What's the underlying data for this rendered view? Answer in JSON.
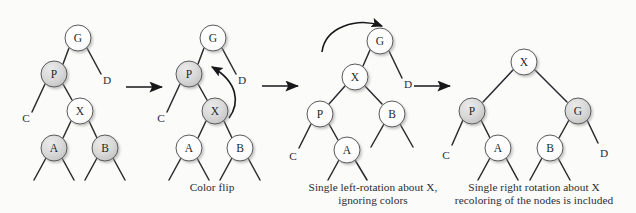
{
  "figure": {
    "background_color": "#fbfbfa",
    "node_fill_black": "#d6d6d6",
    "node_fill_red": "#fdfdfd",
    "node_stroke": "#5a5a5a",
    "edge_color": "#2b2b2f",
    "arrow_color": "#17171a",
    "text_color": "#2b2b33"
  },
  "steps": [
    {
      "id": "step-1",
      "caption": "",
      "nodes": [
        {
          "name": "G",
          "shade": "light",
          "cx": 78,
          "cy": 38
        },
        {
          "name": "P",
          "shade": "dark",
          "cx": 54,
          "cy": 74
        },
        {
          "name": "X",
          "shade": "light",
          "cx": 80,
          "cy": 111
        },
        {
          "name": "A",
          "shade": "dark",
          "cx": 54,
          "cy": 148
        },
        {
          "name": "B",
          "shade": "dark",
          "cx": 105,
          "cy": 148
        }
      ],
      "edge_labels": [
        {
          "name": "D",
          "x": 107,
          "y": 84
        },
        {
          "name": "C",
          "x": 26,
          "y": 122
        }
      ]
    },
    {
      "id": "step-2",
      "caption": "Color flip",
      "nodes": [
        {
          "name": "G",
          "shade": "light",
          "cx": 213,
          "cy": 38
        },
        {
          "name": "P",
          "shade": "dark",
          "cx": 189,
          "cy": 74
        },
        {
          "name": "X",
          "shade": "dark",
          "cx": 215,
          "cy": 111
        },
        {
          "name": "A",
          "shade": "light",
          "cx": 189,
          "cy": 148
        },
        {
          "name": "B",
          "shade": "light",
          "cx": 240,
          "cy": 148
        }
      ],
      "edge_labels": [
        {
          "name": "D",
          "x": 242,
          "y": 84
        },
        {
          "name": "C",
          "x": 161,
          "y": 122
        }
      ],
      "curved_arrow": "from X up to P"
    },
    {
      "id": "step-3",
      "caption": "Single left-rotation about X,\nignoring colors",
      "nodes": [
        {
          "name": "G",
          "shade": "light",
          "cx": 380,
          "cy": 41
        },
        {
          "name": "X",
          "shade": "light",
          "cx": 355,
          "cy": 77
        },
        {
          "name": "P",
          "shade": "light",
          "cx": 320,
          "cy": 114
        },
        {
          "name": "B",
          "shade": "light",
          "cx": 392,
          "cy": 114
        },
        {
          "name": "A",
          "shade": "light",
          "cx": 347,
          "cy": 150
        }
      ],
      "edge_labels": [
        {
          "name": "D",
          "x": 408,
          "y": 88
        },
        {
          "name": "C",
          "x": 293,
          "y": 160
        }
      ],
      "curved_arrow": "counter-clockwise over G"
    },
    {
      "id": "step-4",
      "caption": "Single right rotation about X\nrecoloring of the nodes is included",
      "nodes": [
        {
          "name": "X",
          "shade": "light",
          "cx": 524,
          "cy": 62
        },
        {
          "name": "P",
          "shade": "dark",
          "cx": 472,
          "cy": 111
        },
        {
          "name": "G",
          "shade": "dark",
          "cx": 578,
          "cy": 111
        },
        {
          "name": "A",
          "shade": "light",
          "cx": 498,
          "cy": 148
        },
        {
          "name": "B",
          "shade": "light",
          "cx": 550,
          "cy": 148
        }
      ],
      "edge_labels": [
        {
          "name": "C",
          "x": 446,
          "y": 159
        },
        {
          "name": "D",
          "x": 604,
          "y": 157
        }
      ]
    }
  ],
  "transition_arrows": [
    {
      "name": "arrow-1",
      "x1": 126,
      "y1": 87,
      "x2": 166,
      "y2": 87
    },
    {
      "name": "arrow-2",
      "x1": 262,
      "y1": 86,
      "x2": 302,
      "y2": 86
    },
    {
      "name": "arrow-3",
      "x1": 414,
      "y1": 86,
      "x2": 454,
      "y2": 86
    }
  ]
}
